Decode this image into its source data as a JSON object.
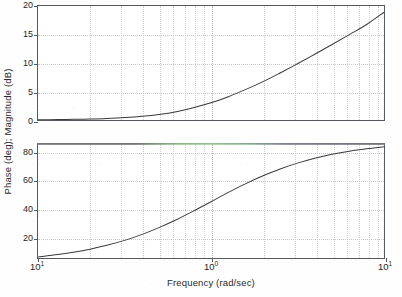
{
  "figure": {
    "width": 402,
    "height": 297,
    "background_color": "#fefefe",
    "line_color": "#3a3a3e",
    "axis_color": "#555a5e",
    "grid_color": "#c8c8c8"
  },
  "axis_titles": {
    "ylabel": "Phase (deg); Magnitude (dB)",
    "xlabel": "Frequency (rad/sec)"
  },
  "xticks": [
    {
      "label_base": "10",
      "label_exp": "1",
      "value": 0.1
    },
    {
      "label_base": "10",
      "label_exp": "0",
      "value": 1
    },
    {
      "label_base": "10",
      "label_exp": "1",
      "value": 10
    }
  ],
  "magnitude_yticks": [
    "0",
    "5",
    "10",
    "15",
    "20"
  ],
  "phase_yticks": [
    "20",
    "40",
    "60",
    "80"
  ],
  "chart_data": [
    {
      "type": "line",
      "title": "",
      "subplot": "magnitude",
      "xlabel": "Frequency (rad/sec)",
      "ylabel": "Magnitude (dB)",
      "xscale": "log",
      "xlim": [
        0.1,
        10
      ],
      "ylim": [
        0,
        20
      ],
      "grid": true,
      "legend": "none",
      "xtick_labels": [
        "10^1",
        "10^0",
        "10^1"
      ],
      "ytick_labels": [
        "0",
        "5",
        "10",
        "15",
        "20"
      ],
      "ytick_values": [
        0,
        5,
        10,
        15,
        20
      ],
      "series": [
        {
          "name": "Magnitude",
          "color": "#3a3a3e",
          "x": [
            0.1,
            0.13,
            0.16,
            0.2,
            0.25,
            0.32,
            0.4,
            0.5,
            0.63,
            0.79,
            1.0,
            1.26,
            1.58,
            2.0,
            2.51,
            3.16,
            3.98,
            5.01,
            6.31,
            7.94,
            10.0
          ],
          "y": [
            0.04,
            0.07,
            0.11,
            0.17,
            0.26,
            0.42,
            0.64,
            0.97,
            1.46,
            2.15,
            3.01,
            4.08,
            5.33,
            6.73,
            8.25,
            9.86,
            11.53,
            13.24,
            14.99,
            16.75,
            18.9
          ]
        }
      ]
    },
    {
      "type": "line",
      "title": "",
      "subplot": "phase",
      "xlabel": "Frequency (rad/sec)",
      "ylabel": "Phase (deg)",
      "xscale": "log",
      "xlim": [
        0.1,
        10
      ],
      "ylim": [
        5,
        86
      ],
      "grid": true,
      "legend": "none",
      "xtick_labels": [
        "10^1",
        "10^0",
        "10^1"
      ],
      "ytick_labels": [
        "20",
        "40",
        "60",
        "80"
      ],
      "ytick_values": [
        20,
        40,
        60,
        80
      ],
      "series": [
        {
          "name": "Phase",
          "color": "#3a3a3e",
          "x": [
            0.1,
            0.13,
            0.16,
            0.2,
            0.25,
            0.32,
            0.4,
            0.5,
            0.63,
            0.79,
            1.0,
            1.26,
            1.58,
            2.0,
            2.51,
            3.16,
            3.98,
            5.01,
            6.31,
            7.94,
            10.0
          ],
          "y": [
            5.7,
            7.4,
            9.1,
            11.3,
            14.0,
            17.7,
            21.8,
            26.6,
            32.2,
            38.3,
            45.0,
            51.6,
            57.7,
            63.4,
            68.3,
            72.4,
            75.9,
            78.7,
            80.9,
            82.6,
            84.0
          ]
        }
      ]
    }
  ]
}
